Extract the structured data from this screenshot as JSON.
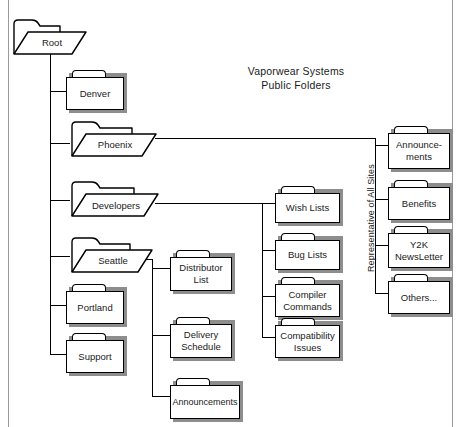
{
  "title": {
    "line1": "Vaporwear Systems",
    "line2": "Public Folders",
    "text": "Vaporwear Systems\nPublic Folders"
  },
  "side_caption": {
    "text": "Representative of All Sites"
  },
  "tree": {
    "root": {
      "label": "Root",
      "type": "open-folder"
    },
    "root_children": [
      {
        "label": "Denver",
        "type": "closed-folder"
      },
      {
        "label": "Phoenix",
        "type": "open-folder"
      },
      {
        "label": "Developers",
        "type": "open-folder"
      },
      {
        "label": "Seattle",
        "type": "open-folder"
      },
      {
        "label": "Portland",
        "type": "closed-folder"
      },
      {
        "label": "Support",
        "type": "closed-folder"
      }
    ],
    "developers_children": [
      {
        "label": "Wish Lists",
        "type": "closed-folder"
      },
      {
        "label": "Bug Lists",
        "type": "closed-folder"
      },
      {
        "label": "Compiler\nCommands",
        "type": "closed-folder"
      },
      {
        "label": "Compatibility\nIssues",
        "type": "closed-folder"
      }
    ],
    "seattle_children": [
      {
        "label": "Distributor\nList",
        "type": "closed-folder"
      },
      {
        "label": "Delivery\nSchedule",
        "type": "closed-folder"
      },
      {
        "label": "Announcements",
        "type": "closed-folder"
      }
    ],
    "phoenix_children": [
      {
        "label": "Announce-\nments",
        "type": "closed-folder"
      },
      {
        "label": "Benefits",
        "type": "closed-folder"
      },
      {
        "label": "Y2K\nNewsLetter",
        "type": "closed-folder"
      },
      {
        "label": "Others...",
        "type": "closed-folder"
      }
    ]
  },
  "colors": {
    "stroke": "#000000",
    "fill": "#ffffff",
    "shadow": "#8d8d8d",
    "frame": "#9a9a9a",
    "text": "#1a1a1a"
  }
}
